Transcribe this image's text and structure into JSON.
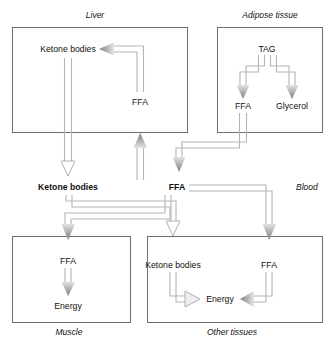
{
  "diagram": {
    "type": "flow-diagram",
    "background": "#ffffff",
    "line_color": "#9a9a9a",
    "arrow_fill_dark": "#8a8a8a",
    "arrow_fill_light": "#d8d8d8",
    "box_border": "#6e6e6e",
    "text_color": "#111111"
  },
  "compartments": {
    "liver": {
      "label": "Liver",
      "nodes": {
        "ketone_bodies": "Ketone bodies",
        "ffa": "FFA"
      }
    },
    "adipose": {
      "label": "Adipose tissue",
      "nodes": {
        "tag": "TAG",
        "ffa": "FFA",
        "glycerol": "Glycerol"
      }
    },
    "blood": {
      "label": "Blood",
      "nodes": {
        "ketone_bodies": "Ketone bodies",
        "ffa": "FFA"
      }
    },
    "muscle": {
      "label": "Muscle",
      "nodes": {
        "ffa": "FFA",
        "energy": "Energy"
      }
    },
    "other": {
      "label": "Other tissues",
      "nodes": {
        "ketone_bodies": "Ketone bodies",
        "ffa": "FFA",
        "energy": "Energy"
      }
    }
  },
  "flows": [
    {
      "from": "adipose.tag",
      "to": "adipose.ffa",
      "style": "solid-dark"
    },
    {
      "from": "adipose.tag",
      "to": "adipose.glycerol",
      "style": "solid-dark"
    },
    {
      "from": "adipose.ffa",
      "to": "blood.ffa",
      "style": "solid-dark"
    },
    {
      "from": "blood.ffa",
      "to": "liver.ffa",
      "style": "solid-dark"
    },
    {
      "from": "liver.ffa",
      "to": "liver.ketone_bodies",
      "style": "solid-dark"
    },
    {
      "from": "liver.ketone_bodies",
      "to": "blood.ketone_bodies",
      "style": "outline"
    },
    {
      "from": "blood.ketone_bodies",
      "to": "other.ketone_bodies",
      "style": "outline"
    },
    {
      "from": "blood.ffa",
      "to": "muscle.ffa",
      "style": "solid-dark"
    },
    {
      "from": "blood.ffa",
      "to": "other.ffa",
      "style": "solid-dark"
    },
    {
      "from": "muscle.ffa",
      "to": "muscle.energy",
      "style": "solid-dark"
    },
    {
      "from": "other.ketone_bodies",
      "to": "other.energy",
      "style": "outline"
    },
    {
      "from": "other.ffa",
      "to": "other.energy",
      "style": "solid-dark"
    }
  ]
}
